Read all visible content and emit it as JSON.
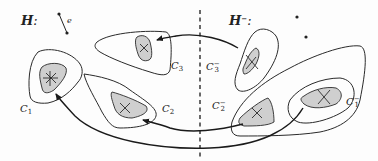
{
  "figure": {
    "left_panel": {
      "title": "H",
      "title_suffix": ":",
      "edge_label": "e",
      "components": [
        {
          "name": "C",
          "index": "1",
          "crosses": 2
        },
        {
          "name": "C",
          "index": "2",
          "crosses": 1
        },
        {
          "name": "C",
          "index": "3",
          "crosses": 1
        }
      ]
    },
    "right_panel": {
      "title": "H",
      "title_sup": "−",
      "title_suffix": ":",
      "isolated_vertices": 2,
      "components": [
        {
          "name": "C",
          "index": "1",
          "sup": "−",
          "crosses": 1
        },
        {
          "name": "C",
          "index": "2",
          "sup": "−",
          "crosses": 1
        },
        {
          "name": "C",
          "index": "3",
          "sup": "−",
          "crosses": 1
        }
      ]
    },
    "arrows": [
      {
        "from": "C3−",
        "to": "C3"
      },
      {
        "from": "C2−",
        "to": "C2"
      },
      {
        "from": "C1−",
        "to": "C1"
      }
    ],
    "colors": {
      "stroke": "#2a2a2a",
      "fill_inner": "#cfcfcf",
      "background": "#fdfdfd"
    }
  }
}
